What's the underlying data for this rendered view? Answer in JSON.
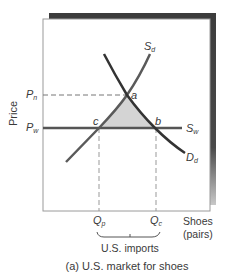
{
  "diagram": {
    "caption": "(a) U.S. market for shoes",
    "y_axis_label": "Price",
    "x_axis_label_line1": "Shoes",
    "x_axis_label_line2": "(pairs)",
    "price_labels": {
      "pn": {
        "main": "P",
        "sub": "n"
      },
      "pw": {
        "main": "P",
        "sub": "w"
      }
    },
    "quantity_labels": {
      "qp": {
        "main": "Q",
        "sub": "p"
      },
      "qc": {
        "main": "Q",
        "sub": "c"
      }
    },
    "curve_labels": {
      "sd": {
        "main": "S",
        "sub": "d"
      },
      "dd": {
        "main": "D",
        "sub": "d"
      },
      "sw": {
        "main": "S",
        "sub": "w"
      }
    },
    "points": {
      "a": "a",
      "b": "b",
      "c": "c"
    },
    "bracket_label": "U.S. imports",
    "colors": {
      "frame_shadow": "#3c3c3c",
      "curve": "#4a4a4a",
      "demand": "#333333",
      "shaded_area": "#d4d4d4",
      "dashed": "#777777"
    }
  }
}
